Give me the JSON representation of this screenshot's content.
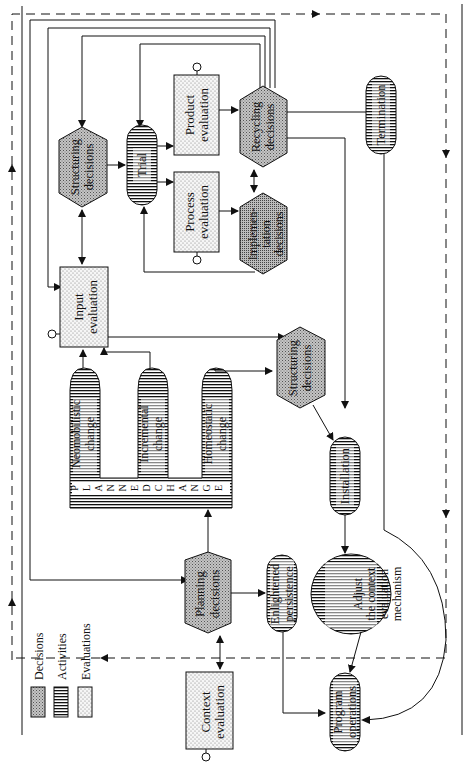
{
  "legend": {
    "decisions": "Decisions",
    "activities": "Activities",
    "evaluations": "Evaluations"
  },
  "nodes": {
    "context_evaluation": [
      "Context",
      "evaluation"
    ],
    "planning_decisions": [
      "Planning",
      "decisions"
    ],
    "enlightened_persistence": [
      "Enlightened",
      "persistence"
    ],
    "adjust_mechanism": [
      "Adjust",
      "the context",
      "evaluation",
      "mechanism"
    ],
    "program_operations": [
      "Program",
      "operations"
    ],
    "planned_change": [
      "P",
      "L",
      "A",
      "N",
      "N",
      "E",
      "D",
      "C",
      "H",
      "A",
      "N",
      "G",
      "E"
    ],
    "neomobilistic_change": [
      "Neomobilistic",
      "change"
    ],
    "incremental_change": [
      "Incremental",
      "change"
    ],
    "homeostatic_change": [
      "Homeostatic",
      "change"
    ],
    "input_evaluation": [
      "Input",
      "evaluation"
    ],
    "structuring_decisions_1": [
      "Structuring",
      "decisions"
    ],
    "structuring_decisions_2": [
      "Structuring",
      "decisions"
    ],
    "installation": [
      "Installation"
    ],
    "trial": [
      "Trial"
    ],
    "product_evaluation": [
      "Product",
      "evaluation"
    ],
    "process_evaluation": [
      "Process",
      "evaluation"
    ],
    "recycling_decisions": [
      "Recycling",
      "decisions"
    ],
    "implementation_decisions": [
      "Implemen-",
      "tation",
      "decisions"
    ],
    "termination": [
      "Termination"
    ]
  },
  "colors": {
    "line": "#111111",
    "decision_fill": "#b8b8b8",
    "evaluation_fill": "#f2f2f2",
    "background": "#ffffff"
  }
}
